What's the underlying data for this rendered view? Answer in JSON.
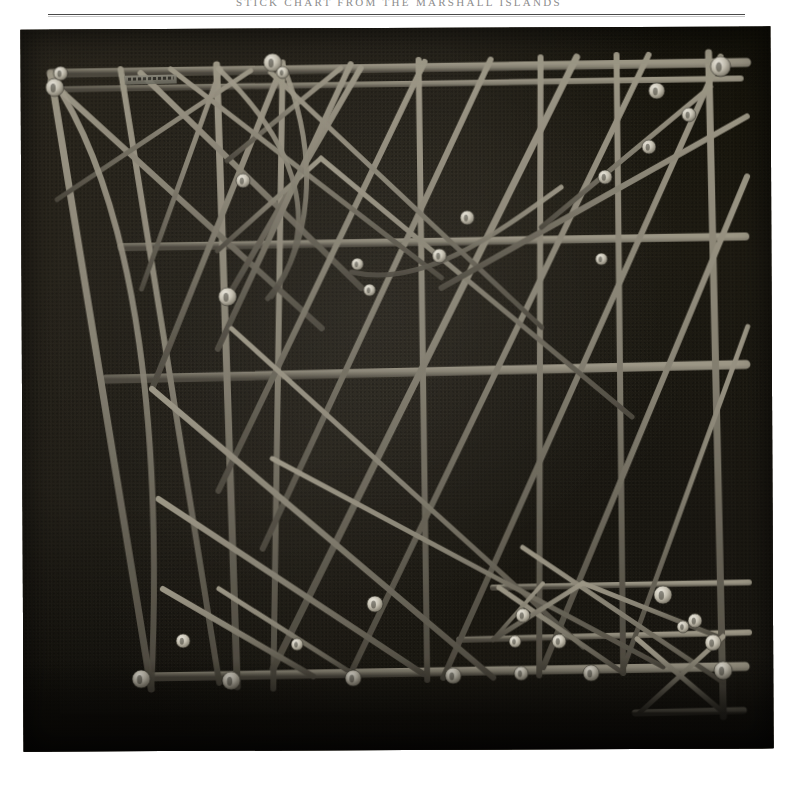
{
  "page": {
    "running_header": "STICK CHART FROM THE MARSHALL ISLANDS",
    "background_color": "#ffffff",
    "rule_color": "#3a3a3a"
  },
  "plate": {
    "name": "stick-chart-photograph",
    "caption": "",
    "subject": "Marshall Islands navigational stick chart (rebbelib) of lashed sticks with cowrie shells marking islands",
    "background_color": "#17150f",
    "stick_color": "#8b8677",
    "shell_color": "#cfcabb",
    "label_tag": "",
    "width_px": 750,
    "height_px": 722
  },
  "chart_data": {
    "type": "diagram",
    "frame": {
      "x": 36,
      "y": 22,
      "w": 676,
      "h": 640
    },
    "sticks": [
      {
        "kind": "line",
        "x1": 30,
        "y1": 44,
        "x2": 726,
        "y2": 36,
        "w": 9
      },
      {
        "kind": "line",
        "x1": 34,
        "y1": 60,
        "x2": 720,
        "y2": 52,
        "w": 6
      },
      {
        "kind": "line",
        "x1": 100,
        "y1": 218,
        "x2": 724,
        "y2": 210,
        "w": 8
      },
      {
        "kind": "line",
        "x1": 84,
        "y1": 350,
        "x2": 724,
        "y2": 338,
        "w": 9
      },
      {
        "kind": "line",
        "x1": 118,
        "y1": 648,
        "x2": 722,
        "y2": 640,
        "w": 9
      },
      {
        "kind": "line",
        "x1": 470,
        "y1": 560,
        "x2": 726,
        "y2": 556,
        "w": 6
      },
      {
        "kind": "line",
        "x1": 436,
        "y1": 612,
        "x2": 726,
        "y2": 606,
        "w": 6
      },
      {
        "kind": "line",
        "x1": 612,
        "y1": 686,
        "x2": 720,
        "y2": 684,
        "w": 7
      },
      {
        "kind": "line",
        "x1": 30,
        "y1": 44,
        "x2": 128,
        "y2": 660,
        "w": 7
      },
      {
        "kind": "line",
        "x1": 100,
        "y1": 40,
        "x2": 196,
        "y2": 654,
        "w": 6
      },
      {
        "kind": "line",
        "x1": 196,
        "y1": 36,
        "x2": 214,
        "y2": 658,
        "w": 7
      },
      {
        "kind": "line",
        "x1": 262,
        "y1": 34,
        "x2": 250,
        "y2": 660,
        "w": 6
      },
      {
        "kind": "line",
        "x1": 398,
        "y1": 32,
        "x2": 404,
        "y2": 652,
        "w": 6
      },
      {
        "kind": "line",
        "x1": 520,
        "y1": 30,
        "x2": 516,
        "y2": 648,
        "w": 6
      },
      {
        "kind": "line",
        "x1": 596,
        "y1": 28,
        "x2": 600,
        "y2": 646,
        "w": 6
      },
      {
        "kind": "line",
        "x1": 688,
        "y1": 26,
        "x2": 700,
        "y2": 690,
        "w": 7
      },
      {
        "kind": "line",
        "x1": 30,
        "y1": 52,
        "x2": 300,
        "y2": 300,
        "w": 6
      },
      {
        "kind": "line",
        "x1": 36,
        "y1": 170,
        "x2": 230,
        "y2": 42,
        "w": 5
      },
      {
        "kind": "line",
        "x1": 120,
        "y1": 44,
        "x2": 340,
        "y2": 260,
        "w": 6
      },
      {
        "kind": "line",
        "x1": 200,
        "y1": 40,
        "x2": 120,
        "y2": 260,
        "w": 5
      },
      {
        "kind": "line",
        "x1": 262,
        "y1": 36,
        "x2": 130,
        "y2": 360,
        "w": 6
      },
      {
        "kind": "line",
        "x1": 206,
        "y1": 132,
        "x2": 320,
        "y2": 40,
        "w": 5
      },
      {
        "kind": "line",
        "x1": 210,
        "y1": 262,
        "x2": 340,
        "y2": 40,
        "w": 6
      },
      {
        "kind": "line",
        "x1": 196,
        "y1": 222,
        "x2": 300,
        "y2": 130,
        "w": 5
      },
      {
        "kind": "line",
        "x1": 330,
        "y1": 36,
        "x2": 196,
        "y2": 320,
        "w": 6
      },
      {
        "kind": "line",
        "x1": 404,
        "y1": 34,
        "x2": 196,
        "y2": 462,
        "w": 6
      },
      {
        "kind": "line",
        "x1": 470,
        "y1": 32,
        "x2": 240,
        "y2": 520,
        "w": 6
      },
      {
        "kind": "line",
        "x1": 556,
        "y1": 30,
        "x2": 250,
        "y2": 640,
        "w": 7
      },
      {
        "kind": "line",
        "x1": 628,
        "y1": 28,
        "x2": 330,
        "y2": 640,
        "w": 6
      },
      {
        "kind": "line",
        "x1": 700,
        "y1": 30,
        "x2": 420,
        "y2": 650,
        "w": 6
      },
      {
        "kind": "line",
        "x1": 726,
        "y1": 150,
        "x2": 520,
        "y2": 640,
        "w": 6
      },
      {
        "kind": "line",
        "x1": 726,
        "y1": 300,
        "x2": 600,
        "y2": 642,
        "w": 5
      },
      {
        "kind": "line",
        "x1": 150,
        "y1": 40,
        "x2": 420,
        "y2": 250,
        "w": 5
      },
      {
        "kind": "line",
        "x1": 250,
        "y1": 44,
        "x2": 520,
        "y2": 300,
        "w": 5
      },
      {
        "kind": "line",
        "x1": 300,
        "y1": 130,
        "x2": 610,
        "y2": 390,
        "w": 5
      },
      {
        "kind": "line",
        "x1": 130,
        "y1": 360,
        "x2": 470,
        "y2": 650,
        "w": 6
      },
      {
        "kind": "line",
        "x1": 210,
        "y1": 300,
        "x2": 560,
        "y2": 620,
        "w": 5
      },
      {
        "kind": "line",
        "x1": 136,
        "y1": 470,
        "x2": 400,
        "y2": 646,
        "w": 6
      },
      {
        "kind": "line",
        "x1": 250,
        "y1": 430,
        "x2": 640,
        "y2": 640,
        "w": 5
      },
      {
        "kind": "line",
        "x1": 140,
        "y1": 560,
        "x2": 290,
        "y2": 648,
        "w": 6
      },
      {
        "kind": "line",
        "x1": 196,
        "y1": 560,
        "x2": 330,
        "y2": 646,
        "w": 5
      },
      {
        "kind": "line",
        "x1": 420,
        "y1": 260,
        "x2": 726,
        "y2": 90,
        "w": 6
      },
      {
        "kind": "line",
        "x1": 520,
        "y1": 200,
        "x2": 690,
        "y2": 60,
        "w": 5
      },
      {
        "kind": "line",
        "x1": 476,
        "y1": 560,
        "x2": 600,
        "y2": 646,
        "w": 5
      },
      {
        "kind": "line",
        "x1": 500,
        "y1": 520,
        "x2": 700,
        "y2": 656,
        "w": 5
      },
      {
        "kind": "line",
        "x1": 560,
        "y1": 556,
        "x2": 700,
        "y2": 612,
        "w": 5
      },
      {
        "kind": "line",
        "x1": 614,
        "y1": 612,
        "x2": 700,
        "y2": 686,
        "w": 5
      },
      {
        "kind": "line",
        "x1": 700,
        "y1": 610,
        "x2": 616,
        "y2": 686,
        "w": 5
      },
      {
        "kind": "line",
        "x1": 470,
        "y1": 612,
        "x2": 560,
        "y2": 556,
        "w": 5
      },
      {
        "kind": "line",
        "x1": 520,
        "y1": 556,
        "x2": 470,
        "y2": 612,
        "w": 4
      }
    ],
    "curves": [
      {
        "kind": "curve",
        "d": "M 198,40 C 280,120 300,200 250,268",
        "w": 5
      },
      {
        "kind": "curve",
        "d": "M 262,36 C 300,130 290,220 246,270",
        "w": 5
      },
      {
        "kind": "curve",
        "d": "M 30,46 C 120,180 140,420 128,660",
        "w": 6
      },
      {
        "kind": "curve",
        "d": "M 330,244 C 400,260 470,210 540,160",
        "w": 5
      }
    ],
    "shells": [
      {
        "cx": 34,
        "cy": 58,
        "r": 9
      },
      {
        "cx": 252,
        "cy": 34,
        "r": 9
      },
      {
        "cx": 700,
        "cy": 40,
        "r": 10
      },
      {
        "cx": 636,
        "cy": 64,
        "r": 8
      },
      {
        "cx": 668,
        "cy": 88,
        "r": 7
      },
      {
        "cx": 584,
        "cy": 150,
        "r": 7
      },
      {
        "cx": 628,
        "cy": 120,
        "r": 7
      },
      {
        "cx": 446,
        "cy": 190,
        "r": 7
      },
      {
        "cx": 222,
        "cy": 152,
        "r": 7
      },
      {
        "cx": 206,
        "cy": 268,
        "r": 9
      },
      {
        "cx": 336,
        "cy": 236,
        "r": 6
      },
      {
        "cx": 348,
        "cy": 262,
        "r": 6
      },
      {
        "cx": 418,
        "cy": 228,
        "r": 7
      },
      {
        "cx": 580,
        "cy": 232,
        "r": 6
      },
      {
        "cx": 352,
        "cy": 576,
        "r": 8
      },
      {
        "cx": 640,
        "cy": 568,
        "r": 9
      },
      {
        "cx": 500,
        "cy": 588,
        "r": 7
      },
      {
        "cx": 672,
        "cy": 594,
        "r": 7
      },
      {
        "cx": 660,
        "cy": 600,
        "r": 6
      },
      {
        "cx": 536,
        "cy": 614,
        "r": 7
      },
      {
        "cx": 492,
        "cy": 614,
        "r": 6
      },
      {
        "cx": 690,
        "cy": 616,
        "r": 8
      },
      {
        "cx": 118,
        "cy": 650,
        "r": 9
      },
      {
        "cx": 208,
        "cy": 652,
        "r": 9
      },
      {
        "cx": 330,
        "cy": 650,
        "r": 8
      },
      {
        "cx": 430,
        "cy": 648,
        "r": 8
      },
      {
        "cx": 498,
        "cy": 646,
        "r": 7
      },
      {
        "cx": 568,
        "cy": 646,
        "r": 8
      },
      {
        "cx": 700,
        "cy": 644,
        "r": 9
      },
      {
        "cx": 40,
        "cy": 44,
        "r": 7
      },
      {
        "cx": 160,
        "cy": 612,
        "r": 7
      },
      {
        "cx": 274,
        "cy": 616,
        "r": 6
      },
      {
        "cx": 262,
        "cy": 44,
        "r": 6
      }
    ]
  }
}
